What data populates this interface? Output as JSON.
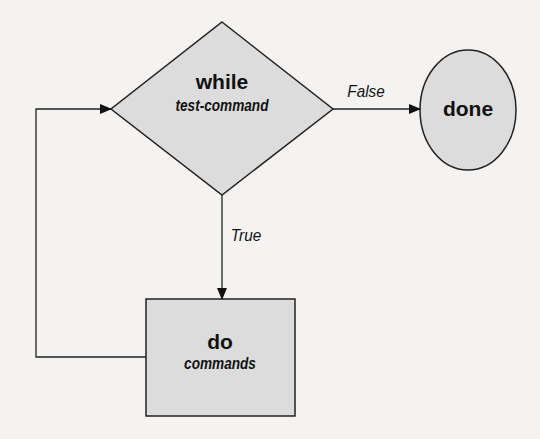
{
  "diagram": {
    "type": "flowchart",
    "colors": {
      "fill": "#dcdcdc",
      "stroke": "#222222",
      "background": "#f4f3f1"
    },
    "nodes": [
      {
        "id": "while",
        "shape": "diamond",
        "keyword": "while",
        "text": "test-command"
      },
      {
        "id": "done",
        "shape": "ellipse",
        "keyword": "done"
      },
      {
        "id": "do",
        "shape": "rectangle",
        "keyword": "do",
        "text": "commands"
      }
    ],
    "edges": [
      {
        "from": "while",
        "to": "done",
        "label": "False"
      },
      {
        "from": "while",
        "to": "do",
        "label": "True"
      },
      {
        "from": "do",
        "to": "while",
        "label": ""
      }
    ]
  }
}
